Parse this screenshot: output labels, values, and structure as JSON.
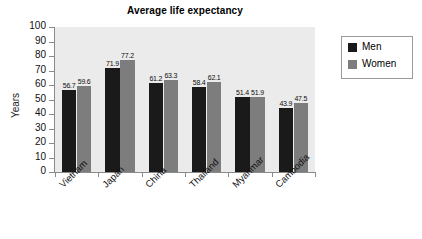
{
  "chart_data": {
    "type": "bar",
    "title": "Average life expectancy",
    "xlabel": "",
    "ylabel": "Years",
    "ylim": [
      0,
      100
    ],
    "yticks": [
      0,
      10,
      20,
      30,
      40,
      50,
      60,
      70,
      80,
      90,
      100
    ],
    "ytick_labels": [
      "0",
      "10",
      "20",
      "30",
      "40",
      "50",
      "60",
      "70",
      "80",
      "90",
      "100"
    ],
    "grid": false,
    "legend_position": "right",
    "categories": [
      "Vietnam",
      "Japan",
      "China",
      "Thailand",
      "Myanmar",
      "Cambodia"
    ],
    "series": [
      {
        "name": "Men",
        "color": "#1a1a1a",
        "values": [
          56.7,
          71.9,
          61.2,
          58.4,
          51.4,
          43.9
        ],
        "value_labels": [
          "56.7",
          "71.9",
          "61.2",
          "58.4",
          "51.4",
          "43.9"
        ]
      },
      {
        "name": "Women",
        "color": "#7d7d7d",
        "values": [
          59.6,
          77.2,
          63.3,
          62.1,
          51.9,
          47.5
        ],
        "value_labels": [
          "59.6",
          "77.2",
          "63.3",
          "62.1",
          "51.9",
          "47.5"
        ]
      }
    ],
    "plot_background": "#ebebeb",
    "canvas_background": "#ffffff",
    "axis_color": "#8a8a8a"
  },
  "legend": {
    "items": [
      {
        "label": "Men",
        "color": "#1a1a1a"
      },
      {
        "label": "Women",
        "color": "#7d7d7d"
      }
    ]
  }
}
